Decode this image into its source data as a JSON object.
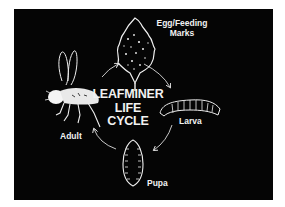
{
  "diagram": {
    "title_lines": [
      "LEAFMINER",
      "LIFE",
      "CYCLE"
    ],
    "stages": [
      {
        "id": "egg",
        "label_line1": "Egg/Feeding",
        "label_line2": "Marks",
        "icon": "leaf-icon"
      },
      {
        "id": "larva",
        "label": "Larva",
        "icon": "larva-icon"
      },
      {
        "id": "pupa",
        "label": "Pupa",
        "icon": "pupa-icon"
      },
      {
        "id": "adult",
        "label": "Adult",
        "icon": "fly-icon"
      }
    ],
    "colors": {
      "background": "#050505",
      "foreground": "#f2f2f2",
      "page": "#ffffff"
    }
  }
}
